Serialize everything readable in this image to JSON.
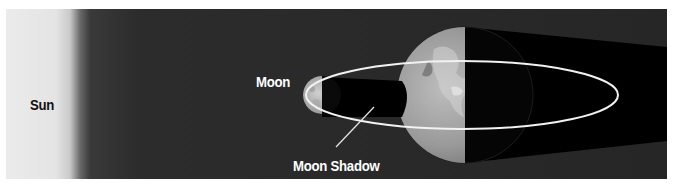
{
  "diagram": {
    "labels": {
      "sun": "Sun",
      "moon": "Moon",
      "moon_shadow": "Moon Shadow"
    },
    "colors": {
      "sun_light": "#ebebeb",
      "space": "#262626",
      "shadow": "#000000",
      "orbit": "#f2f2f2",
      "label_dark": "#111111",
      "label_light": "#ffffff"
    },
    "elements": [
      {
        "name": "sun",
        "position": "left edge"
      },
      {
        "name": "moon",
        "position": "left of earth, on orbit"
      },
      {
        "name": "moon-shadow",
        "position": "cast from moon toward earth"
      },
      {
        "name": "earth",
        "position": "center-right, half lit"
      },
      {
        "name": "earth-shadow",
        "position": "cast to the right of earth"
      },
      {
        "name": "moon-orbit",
        "shape": "ellipse around earth"
      }
    ]
  }
}
